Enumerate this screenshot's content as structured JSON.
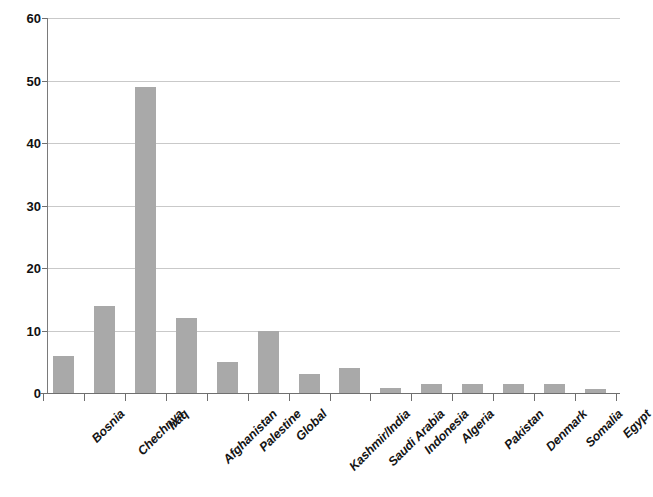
{
  "chart_data": {
    "type": "bar",
    "title": "",
    "subtitle": "",
    "xlabel": "",
    "ylabel": "",
    "ylim": [
      0,
      60
    ],
    "ytick_labels": [
      "0",
      "10",
      "20",
      "30",
      "40",
      "50",
      "60"
    ],
    "ytick_values": [
      0,
      10,
      20,
      30,
      40,
      50,
      60
    ],
    "grid": true,
    "legend": false,
    "legend_position": "none",
    "bar_color": "#a9a9a9",
    "axis_color": "#6f6f6f",
    "grid_color": "#c9c9c9",
    "categories": [
      "Bosnia",
      "Chechnya",
      "Iraq",
      "Afghanistan",
      "Palestine",
      "Global",
      "Kashmir/India",
      "Saudi Arabia",
      "Indonesia",
      "Algeria",
      "Pakistan",
      "Denmark",
      "Somalia",
      "Egypt"
    ],
    "values": [
      6,
      14,
      49,
      12,
      5,
      10,
      3,
      4,
      0.8,
      1.5,
      1.5,
      1.5,
      1.5,
      0.7
    ]
  }
}
